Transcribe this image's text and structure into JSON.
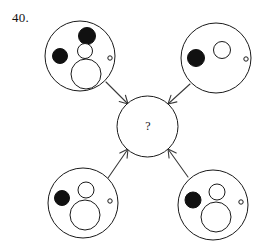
{
  "page": {
    "background_color": "#ffffff",
    "ink_color": "#1a1a1a",
    "width": 276,
    "height": 249
  },
  "question": {
    "number_label": "40.",
    "center_label": "?",
    "type": "visual-analogy-matrix",
    "arrow_direction": "inward-to-center"
  },
  "center_circle": {
    "name": "answer-circle",
    "cx": 147.5,
    "cy": 126.5,
    "r": 30.5,
    "label": "?",
    "fill": "#ffffff",
    "stroke": "#1a1a1a"
  },
  "panels": [
    {
      "id": "top-left",
      "name": "panel-top-left",
      "cx": 80,
      "cy": 56,
      "r": 35,
      "shapes": [
        {
          "name": "large-black-dot-top",
          "kind": "disc",
          "fill": "black",
          "cx": 87,
          "cy": 36,
          "r": 8.5
        },
        {
          "name": "black-dot-left",
          "kind": "disc",
          "fill": "black",
          "cx": 60,
          "cy": 56,
          "r": 7.5
        },
        {
          "name": "medium-white-circle",
          "kind": "circle",
          "fill": "white",
          "cx": 85,
          "cy": 51,
          "r": 7.5
        },
        {
          "name": "large-white-circle",
          "kind": "circle",
          "fill": "white",
          "cx": 86,
          "cy": 74,
          "r": 15
        },
        {
          "name": "tiny-white-dot-right",
          "kind": "circle",
          "fill": "white",
          "cx": 110,
          "cy": 58,
          "r": 2.2
        }
      ]
    },
    {
      "id": "top-right",
      "name": "panel-top-right",
      "cx": 216,
      "cy": 58,
      "r": 35,
      "shapes": [
        {
          "name": "black-dot-left",
          "kind": "disc",
          "fill": "black",
          "cx": 196,
          "cy": 58,
          "r": 8.5
        },
        {
          "name": "medium-white-circle",
          "kind": "circle",
          "fill": "white",
          "cx": 222,
          "cy": 50,
          "r": 8.5
        },
        {
          "name": "tiny-white-dot-right",
          "kind": "circle",
          "fill": "white",
          "cx": 246,
          "cy": 59,
          "r": 2.2
        }
      ]
    },
    {
      "id": "bottom-left",
      "name": "panel-bottom-left",
      "cx": 83,
      "cy": 203,
      "r": 35,
      "shapes": [
        {
          "name": "black-dot-left",
          "kind": "disc",
          "fill": "black",
          "cx": 62,
          "cy": 198,
          "r": 7.5
        },
        {
          "name": "medium-white-circle",
          "kind": "circle",
          "fill": "white",
          "cx": 86,
          "cy": 190,
          "r": 8
        },
        {
          "name": "large-white-circle",
          "kind": "circle",
          "fill": "white",
          "cx": 85,
          "cy": 215,
          "r": 15
        },
        {
          "name": "tiny-white-dot-right",
          "kind": "circle",
          "fill": "white",
          "cx": 110,
          "cy": 201,
          "r": 2.2
        }
      ]
    },
    {
      "id": "bottom-right",
      "name": "panel-bottom-right",
      "cx": 213,
      "cy": 205,
      "r": 35,
      "shapes": [
        {
          "name": "black-dot-left",
          "kind": "disc",
          "fill": "black",
          "cx": 193,
          "cy": 200,
          "r": 8
        },
        {
          "name": "medium-white-circle",
          "kind": "circle",
          "fill": "white",
          "cx": 217,
          "cy": 192,
          "r": 8
        },
        {
          "name": "large-white-circle",
          "kind": "circle",
          "fill": "white",
          "cx": 216,
          "cy": 217,
          "r": 15
        },
        {
          "name": "tiny-white-dot-right",
          "kind": "circle",
          "fill": "white",
          "cx": 241,
          "cy": 202,
          "r": 2.2
        }
      ]
    }
  ],
  "arrows": [
    {
      "name": "arrow-from-top-left",
      "from": "top-left",
      "to": "center",
      "x1": 106,
      "y1": 82,
      "x2": 128,
      "y2": 104
    },
    {
      "name": "arrow-from-top-right",
      "from": "top-right",
      "to": "center",
      "x1": 190,
      "y1": 84,
      "x2": 168,
      "y2": 104
    },
    {
      "name": "arrow-from-bottom-left",
      "from": "bottom-left",
      "to": "center",
      "x1": 108,
      "y1": 178,
      "x2": 128,
      "y2": 149
    },
    {
      "name": "arrow-from-bottom-right",
      "from": "bottom-right",
      "to": "center",
      "x1": 188,
      "y1": 177,
      "x2": 168,
      "y2": 149
    }
  ]
}
